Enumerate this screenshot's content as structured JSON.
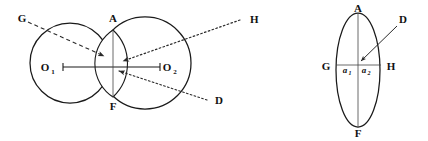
{
  "figure": {
    "background_color": "#ffffff",
    "line_color": "#1a1a1a",
    "left_diagram": {
      "name": "overlapping-circles-diagram",
      "labels": {
        "G": "G",
        "A": "A",
        "H": "H",
        "F": "F",
        "D": "D",
        "O1_base": "O",
        "O1_sub": "1",
        "O2_base": "O",
        "O2_sub": "2"
      },
      "circle1": {
        "cx": 70,
        "cy": 63,
        "r": 40
      },
      "circle2": {
        "cx": 145,
        "cy": 63,
        "r": 46
      },
      "lens": {
        "top_x": 113,
        "top_y": 30,
        "bottom_x": 113,
        "bottom_y": 97
      },
      "axis": {
        "x1": 63,
        "y1": 67,
        "x2": 160,
        "y2": 67
      },
      "rays": [
        {
          "id": "ray-G",
          "style": "dashed",
          "from": [
            28,
            22
          ],
          "to": [
            108,
            58
          ]
        },
        {
          "id": "ray-H-upper",
          "style": "dotted",
          "from": [
            243,
            19
          ],
          "to": [
            118,
            62
          ]
        },
        {
          "id": "ray-D-lower",
          "style": "dotted",
          "from": [
            208,
            101
          ],
          "to": [
            114,
            70
          ]
        }
      ]
    },
    "right_diagram": {
      "name": "lens-detail-diagram",
      "labels": {
        "A": "A",
        "D": "D",
        "G": "G",
        "H": "H",
        "F": "F",
        "a1_base": "a",
        "a1_sub": "1",
        "a2_base": "a",
        "a2_sub": "2"
      },
      "ellipse": {
        "cx": 358,
        "cy": 70,
        "rx": 22,
        "ry": 57
      },
      "vertical_axis": {
        "x": 358,
        "y1": 13,
        "y2": 127
      },
      "horizontal_axis": {
        "x1": 336,
        "y1": 65,
        "x2": 381,
        "y2": 65
      },
      "pointer": {
        "id": "ray-D-detail",
        "style": "solid-arrow",
        "from": [
          399,
          25
        ],
        "to": [
          360,
          62
        ]
      }
    }
  }
}
